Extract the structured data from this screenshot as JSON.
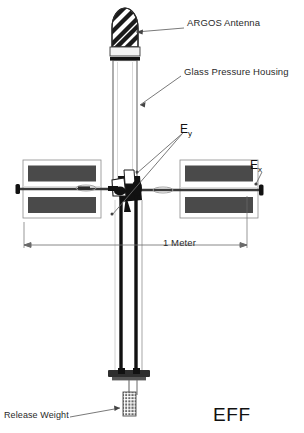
{
  "figure": {
    "identifier": "EFF"
  },
  "labels": {
    "argos_antenna": "ARGOS Antenna",
    "glass_pressure_housing": "Glass Pressure Housing",
    "release_weight": "Release Weight",
    "scale_dimension": "1 Meter",
    "efield_y_base": "E",
    "efield_y_sub": "y",
    "efield_x_base": "E",
    "efield_x_sub": "x",
    "plate_identifier": "EFF"
  },
  "colors": {
    "ink": "#111111",
    "panel_fill": "#4a4a4a",
    "stripe": "#1b1b1b",
    "outline": "#2b2b2b",
    "leader": "#555555",
    "background": "#ffffff"
  },
  "components": {
    "antenna": {
      "name": "argos-antenna",
      "style": "striped-dome",
      "stripe_count": 4
    },
    "collar": {
      "name": "antenna-collar"
    },
    "housing": {
      "name": "glass-pressure-housing",
      "style": "clear-cylinder"
    },
    "hub": {
      "name": "sensor-hub"
    },
    "solar_panel_left": {
      "name": "solar-panel-array-left",
      "cells": 2
    },
    "solar_panel_right": {
      "name": "solar-panel-array-right",
      "cells": 2
    },
    "boom": {
      "name": "horizontal-sensor-boom"
    },
    "mast": {
      "name": "lower-mast-rods",
      "rods": 2
    },
    "base_plate": {
      "name": "base-plate"
    },
    "release_weight": {
      "name": "release-weight",
      "style": "gridded-block"
    }
  }
}
